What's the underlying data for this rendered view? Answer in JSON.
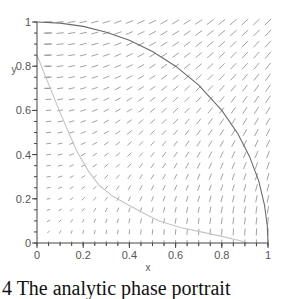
{
  "chart_data": {
    "type": "scatter",
    "subtype": "direction-field",
    "title": "",
    "xlabel": "x",
    "ylabel": "y",
    "xlim": [
      0,
      1
    ],
    "ylim": [
      0,
      1
    ],
    "x_ticks": [
      0,
      0.2,
      0.4,
      0.6,
      0.8,
      1
    ],
    "x_tick_labels": [
      "0",
      "0.2",
      "0.4",
      "0.6",
      "0.8",
      "1"
    ],
    "y_ticks": [
      0,
      0.2,
      0.4,
      0.6,
      0.8,
      1
    ],
    "y_tick_labels": [
      "0",
      "0.2",
      "0.4",
      "0.6",
      "0.8",
      "1"
    ],
    "minor_tick_step": 0.05,
    "grid": false,
    "legend": "none",
    "field": {
      "description": "direction field, arrows roughly along (y, x); horizontal near (0,1), vertical near (1,0), vanishing near origin",
      "grid_step": 0.05,
      "color": "#8a8a8a"
    },
    "series": [
      {
        "name": "quarter-circle-trajectory",
        "color": "#6b6b6b",
        "points": [
          [
            0,
            1
          ],
          [
            0.1,
            0.995
          ],
          [
            0.2,
            0.98
          ],
          [
            0.3,
            0.954
          ],
          [
            0.4,
            0.917
          ],
          [
            0.5,
            0.866
          ],
          [
            0.6,
            0.8
          ],
          [
            0.7,
            0.714
          ],
          [
            0.8,
            0.6
          ],
          [
            0.87,
            0.493
          ],
          [
            0.92,
            0.392
          ],
          [
            0.96,
            0.28
          ],
          [
            0.985,
            0.172
          ],
          [
            0.997,
            0.077
          ],
          [
            1,
            0
          ]
        ]
      },
      {
        "name": "lower-trajectory",
        "color": "#c4c4c4",
        "points": [
          [
            0,
            0.85
          ],
          [
            0.05,
            0.72
          ],
          [
            0.1,
            0.59
          ],
          [
            0.17,
            0.42
          ],
          [
            0.22,
            0.33
          ],
          [
            0.27,
            0.26
          ],
          [
            0.33,
            0.21
          ],
          [
            0.4,
            0.17
          ],
          [
            0.47,
            0.13
          ],
          [
            0.53,
            0.1
          ],
          [
            0.62,
            0.07
          ],
          [
            0.71,
            0.05
          ],
          [
            0.8,
            0.03
          ],
          [
            0.88,
            0.01
          ],
          [
            0.91,
            0
          ]
        ]
      }
    ]
  },
  "caption": {
    "text": "4 The analytic phase portrait"
  }
}
